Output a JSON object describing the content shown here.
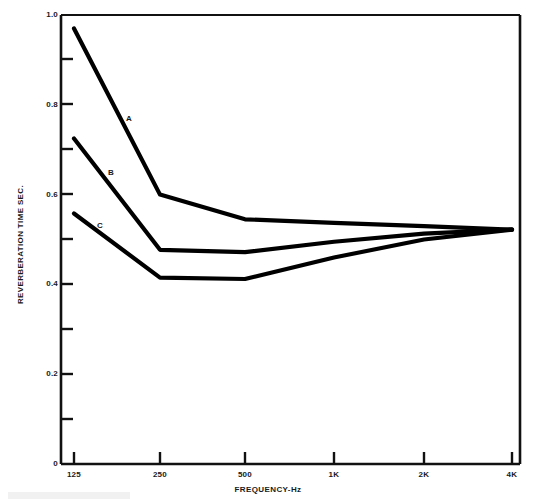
{
  "chart_data": {
    "type": "line",
    "title": "",
    "xlabel": "FREQUENCY-Hz",
    "ylabel": "REVERBERATION TIME SEC.",
    "x": [
      "125",
      "250",
      "500",
      "1K",
      "2K",
      "4K"
    ],
    "xtick_labels": [
      "125",
      "250",
      "500",
      "1K",
      "2K",
      "4K"
    ],
    "ytick_labels": [
      "0",
      "0.2",
      "0.4",
      "0.6",
      "0.8",
      "1.0"
    ],
    "ytick_values": [
      0,
      0.2,
      0.4,
      0.6,
      0.8,
      1.0
    ],
    "yminor_values": [
      0.1,
      0.3,
      0.5,
      0.7,
      0.9
    ],
    "ylim": [
      0,
      1.0
    ],
    "grid": false,
    "legend_position": "inline-annotations",
    "series": [
      {
        "name": "A",
        "label": "A",
        "color": "#000000",
        "values": [
          0.97,
          0.6,
          0.545,
          0.537,
          0.53,
          0.522
        ]
      },
      {
        "name": "B",
        "label": "B",
        "color": "#000000",
        "values": [
          0.725,
          0.477,
          0.472,
          0.495,
          0.513,
          0.522
        ]
      },
      {
        "name": "C",
        "label": "C",
        "color": "#000000",
        "values": [
          0.558,
          0.415,
          0.412,
          0.46,
          0.5,
          0.522
        ]
      }
    ],
    "annotations": [
      {
        "text": "A",
        "x_px": 126,
        "y_px": 114
      },
      {
        "text": "B",
        "x_px": 108,
        "y_px": 168
      },
      {
        "text": "C",
        "x_px": 97,
        "y_px": 221
      }
    ]
  },
  "axes": {
    "y_top_label": "1.0",
    "y_zero_label": "0"
  }
}
